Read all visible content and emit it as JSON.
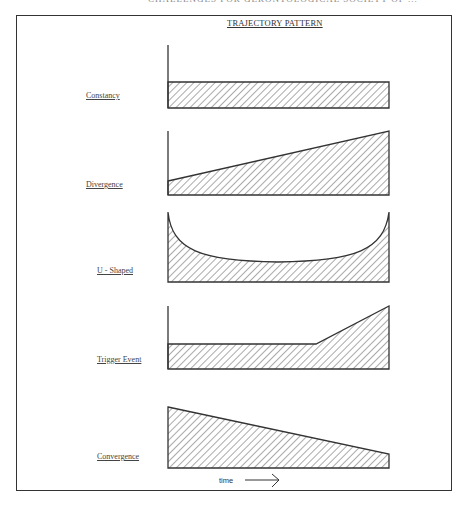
{
  "title": "TRAJECTORY PATTERN",
  "running_head": "CHALLENGES FOR GERONTOLOGICAL SOCIETY OF ...",
  "patterns": [
    {
      "label": "Constancy",
      "shape": "flat"
    },
    {
      "label": "Divergence",
      "shape": "rising-line"
    },
    {
      "label": "U - Shaped",
      "shape": "u-curve"
    },
    {
      "label": "Trigger Event",
      "shape": "flat-then-rise"
    },
    {
      "label": "Convergence",
      "shape": "falling-line"
    }
  ],
  "x_axis": {
    "label": "time",
    "arrow": "right-arrow"
  },
  "colors": {
    "line": "#333333",
    "hatch": "#555555",
    "background": "#ffffff"
  }
}
